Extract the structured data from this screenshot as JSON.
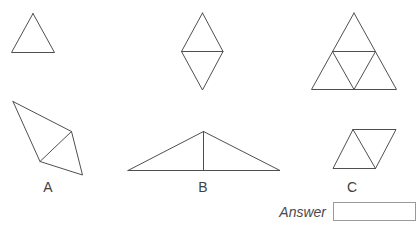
{
  "labels": {
    "a": "A",
    "b": "B",
    "c": "C"
  },
  "answer": {
    "label": "Answer",
    "value": ""
  },
  "colors": {
    "line": "#4f4f4f",
    "label_text": "#3f3f3f",
    "answer_text": "#4a4a4a",
    "box_border": "#9a9a9a",
    "background": "#ffffff"
  },
  "figures": [
    {
      "name": "single-triangle-figure",
      "polylines": [
        [
          [
            33,
            13.5
          ],
          [
            11.5,
            52.5
          ],
          [
            54.5,
            52.5
          ],
          [
            33,
            13.5
          ]
        ]
      ]
    },
    {
      "name": "diamond-two-triangles-figure",
      "polylines": [
        [
          [
            202.5,
            13
          ],
          [
            181.5,
            51.5
          ],
          [
            202.5,
            90
          ],
          [
            223,
            51.5
          ],
          [
            202.5,
            13
          ]
        ],
        [
          [
            181.5,
            51.5
          ],
          [
            223,
            51.5
          ]
        ]
      ]
    },
    {
      "name": "large-triangle-four-parts-figure",
      "polylines": [
        [
          [
            354,
            13
          ],
          [
            311.5,
            89.5
          ],
          [
            396.5,
            89.5
          ],
          [
            354,
            13
          ]
        ],
        [
          [
            332.5,
            51.5
          ],
          [
            375.5,
            51.5
          ],
          [
            354,
            89.5
          ],
          [
            332.5,
            51.5
          ]
        ]
      ]
    },
    {
      "name": "option-a-figure",
      "polylines": [
        [
          [
            13,
            101.5
          ],
          [
            71.5,
            131.5
          ],
          [
            82.5,
            175
          ],
          [
            40,
            161.5
          ],
          [
            13,
            101.5
          ]
        ],
        [
          [
            71.5,
            131.5
          ],
          [
            40,
            161.5
          ]
        ]
      ]
    },
    {
      "name": "option-b-figure",
      "polylines": [
        [
          [
            128,
            170.5
          ],
          [
            203.5,
            131.5
          ],
          [
            280,
            170.5
          ],
          [
            128,
            170.5
          ]
        ],
        [
          [
            203.5,
            131.5
          ],
          [
            203.5,
            170.5
          ]
        ]
      ]
    },
    {
      "name": "option-c-figure",
      "polylines": [
        [
          [
            353,
            129.5
          ],
          [
            396,
            129.5
          ],
          [
            375.5,
            168.5
          ],
          [
            333,
            168.5
          ],
          [
            353,
            129.5
          ]
        ],
        [
          [
            353,
            129.5
          ],
          [
            375.5,
            168.5
          ]
        ]
      ]
    }
  ]
}
